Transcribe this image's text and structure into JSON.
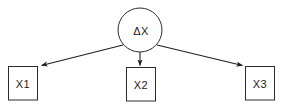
{
  "diagram": {
    "type": "path-diagram",
    "background_color": "#ffffff",
    "stroke_color": "#2b2b2b",
    "text_color": "#1a1a1a",
    "latent": {
      "id": "delta-x",
      "label": "ΔX",
      "shape": "circle",
      "cx": 140,
      "cy": 30,
      "r": 22
    },
    "indicators": [
      {
        "id": "x1",
        "label": "X1",
        "shape": "rectangle",
        "x": 8,
        "y": 66,
        "width": 29,
        "height": 34
      },
      {
        "id": "x2",
        "label": "X2",
        "shape": "rectangle",
        "x": 126,
        "y": 67,
        "width": 29,
        "height": 34
      },
      {
        "id": "x3",
        "label": "X3",
        "shape": "rectangle",
        "x": 245,
        "y": 66,
        "width": 29,
        "height": 34
      }
    ],
    "paths": [
      {
        "id": "path-delta-x-to-x1",
        "from": "delta-x",
        "to": "x1",
        "x1": 123,
        "y1": 45,
        "x2": 39,
        "y2": 66,
        "arrowhead": "filled-triangle"
      },
      {
        "id": "path-delta-x-to-x2",
        "from": "delta-x",
        "to": "x2",
        "x1": 140,
        "y1": 52,
        "x2": 140,
        "y2": 67,
        "arrowhead": "filled-triangle"
      },
      {
        "id": "path-delta-x-to-x3",
        "from": "delta-x",
        "to": "x3",
        "x1": 157,
        "y1": 45,
        "x2": 244,
        "y2": 66,
        "arrowhead": "filled-triangle"
      }
    ]
  }
}
